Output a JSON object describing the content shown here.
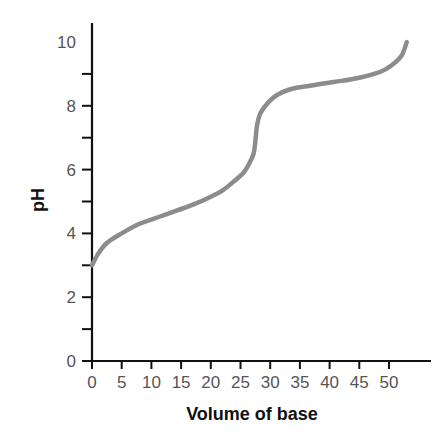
{
  "chart_data": {
    "type": "line",
    "title": "",
    "xlabel": "Volume of base",
    "ylabel": "pH",
    "xlim": [
      0,
      57
    ],
    "ylim": [
      0,
      10.6
    ],
    "grid": false,
    "legend": null,
    "x_ticks": [
      0,
      5,
      10,
      15,
      20,
      25,
      30,
      35,
      40,
      45,
      50
    ],
    "x_tick_labels": [
      "0",
      "5",
      "10",
      "15",
      "20",
      "25",
      "30",
      "35",
      "40",
      "45",
      "50"
    ],
    "y_ticks": [
      0,
      1,
      2,
      3,
      4,
      5,
      6,
      7,
      8,
      9
    ],
    "y_tick_labels": [
      {
        "value": 0,
        "label": "0"
      },
      {
        "value": 2,
        "label": "2"
      },
      {
        "value": 4,
        "label": "4"
      },
      {
        "value": 6,
        "label": "6"
      },
      {
        "value": 8,
        "label": "8"
      },
      {
        "value": 10,
        "label": "10"
      }
    ],
    "series": [
      {
        "name": "Titration curve",
        "color": "#8c8c8c",
        "x": [
          0,
          1,
          2.5,
          5,
          8,
          11,
          14,
          17,
          20,
          22,
          24,
          25.5,
          26.5,
          27.2,
          27.5,
          27.8,
          28.3,
          29.2,
          30.5,
          32,
          34,
          36.5,
          39,
          42,
          45,
          47.5,
          49.5,
          51,
          52.2,
          53
        ],
        "values": [
          3.0,
          3.35,
          3.7,
          4.0,
          4.3,
          4.5,
          4.7,
          4.9,
          5.15,
          5.35,
          5.65,
          5.9,
          6.2,
          6.5,
          6.9,
          7.4,
          7.75,
          8.0,
          8.25,
          8.42,
          8.55,
          8.62,
          8.7,
          8.78,
          8.88,
          9.0,
          9.15,
          9.35,
          9.6,
          10.0
        ]
      }
    ]
  }
}
